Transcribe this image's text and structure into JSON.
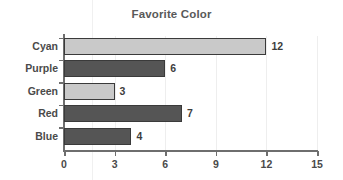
{
  "chart_data": {
    "type": "bar",
    "orientation": "horizontal",
    "title": "Favorite Color",
    "xlabel": "",
    "ylabel": "",
    "categories": [
      "Cyan",
      "Purple",
      "Green",
      "Red",
      "Blue"
    ],
    "values": [
      12,
      6,
      3,
      7,
      4
    ],
    "value_labels": [
      "12",
      "6",
      "3",
      "7",
      "4"
    ],
    "bar_styles": [
      "light",
      "dark",
      "light",
      "dark",
      "dark"
    ],
    "xlim": [
      0,
      15
    ],
    "xticks": [
      0,
      3,
      6,
      9,
      12,
      15
    ],
    "xtick_labels": [
      "0",
      "3",
      "6",
      "9",
      "12",
      "15"
    ],
    "grid": true,
    "grid_axis": "x",
    "legend": false,
    "colors": {
      "bar_light": "#c9c9c9",
      "bar_dark": "#555555",
      "bar_outline": "#3a3a3a",
      "axis": "#6e6e6e",
      "grid": "#eeeeee",
      "title_text": "#595959",
      "label_text": "#4a4a4a",
      "value_text": "#3d3d3d",
      "background": "#ffffff"
    }
  }
}
